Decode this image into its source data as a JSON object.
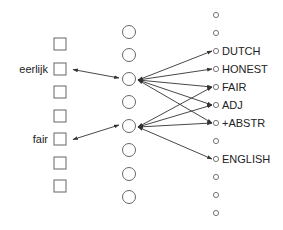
{
  "colors": {
    "stroke": "#666666",
    "arrow": "#333333",
    "text": "#222222"
  },
  "layers": {
    "input": {
      "x": 60,
      "size": 12,
      "nodes": [
        {
          "y": 44,
          "label": ""
        },
        {
          "y": 69,
          "label": "eerlijk"
        },
        {
          "y": 92,
          "label": ""
        },
        {
          "y": 116,
          "label": ""
        },
        {
          "y": 139,
          "label": "fair"
        },
        {
          "y": 163,
          "label": ""
        },
        {
          "y": 186,
          "label": ""
        }
      ]
    },
    "hidden": {
      "x": 129,
      "r": 6.5,
      "ys": [
        32,
        55,
        79,
        102,
        126,
        150,
        174,
        197
      ]
    },
    "output": {
      "x": 216,
      "r": 2.6,
      "nodes": [
        {
          "y": 15,
          "label": ""
        },
        {
          "y": 33,
          "label": ""
        },
        {
          "y": 51,
          "label": "DUTCH"
        },
        {
          "y": 69,
          "label": "HONEST"
        },
        {
          "y": 87,
          "label": "FAIR"
        },
        {
          "y": 105,
          "label": "ADJ"
        },
        {
          "y": 123,
          "label": "+ABSTR"
        },
        {
          "y": 141,
          "label": ""
        },
        {
          "y": 159,
          "label": "ENGLISH"
        },
        {
          "y": 177,
          "label": ""
        },
        {
          "y": 195,
          "label": ""
        },
        {
          "y": 213,
          "label": ""
        }
      ]
    }
  },
  "connections": {
    "input_hidden": [
      {
        "from": 1,
        "to": 2,
        "bidirectional": true
      },
      {
        "from": 4,
        "to": 4,
        "bidirectional": true
      }
    ],
    "hidden_output": [
      {
        "from": 2,
        "to": 2
      },
      {
        "from": 2,
        "to": 3
      },
      {
        "from": 2,
        "to": 4
      },
      {
        "from": 2,
        "to": 5
      },
      {
        "from": 2,
        "to": 6
      },
      {
        "from": 4,
        "to": 4
      },
      {
        "from": 4,
        "to": 5
      },
      {
        "from": 4,
        "to": 6
      },
      {
        "from": 4,
        "to": 8
      }
    ]
  }
}
